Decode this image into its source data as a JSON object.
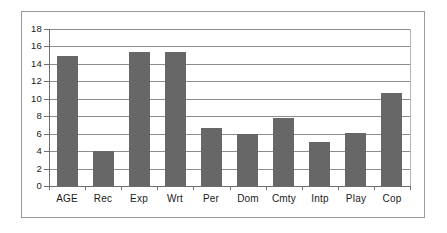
{
  "chart_data": {
    "type": "bar",
    "title": "",
    "xlabel": "",
    "ylabel": "",
    "categories": [
      "AGE",
      "Rec",
      "Exp",
      "Wrt",
      "Per",
      "Dom",
      "Cmty",
      "Intp",
      "Play",
      "Cop"
    ],
    "values": [
      14.9,
      4.0,
      15.4,
      15.4,
      6.7,
      6.0,
      7.8,
      5.1,
      6.05,
      10.7
    ],
    "ylim": [
      0,
      18
    ],
    "ytick_values": [
      0,
      2,
      4,
      6,
      8,
      10,
      12,
      14,
      16,
      18
    ],
    "ytick_labels": [
      "0",
      "2",
      "4",
      "6",
      "8",
      "10",
      "12",
      "14",
      "16",
      "18"
    ],
    "grid": true,
    "legend": false,
    "bar_color": "#676767",
    "grid_color": "#8d8d8d",
    "axis_color": "#6e6e6e",
    "frame_color": "#9a9a9a",
    "background_color": "#ffffff"
  }
}
